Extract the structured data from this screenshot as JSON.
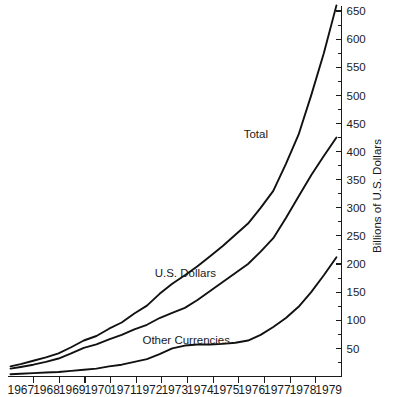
{
  "chart_data": {
    "type": "line",
    "title": "",
    "xlabel": "",
    "ylabel": "Billions of U.S. Dollars",
    "xlim": [
      1966.5,
      1979.7
    ],
    "ylim": [
      0,
      675
    ],
    "grid": false,
    "legend_position": "inline-labels",
    "x_tick_labels": [
      "1967",
      "1968",
      "1969",
      "1970",
      "1971",
      "1972",
      "1973",
      "1974",
      "1975",
      "1976",
      "1977",
      "1978",
      "1979"
    ],
    "y_tick_labels": [
      "50",
      "100",
      "150",
      "200",
      "250",
      "300",
      "350",
      "400",
      "450",
      "500",
      "550",
      "600",
      "650"
    ],
    "y_ticks": [
      50,
      100,
      150,
      200,
      250,
      300,
      350,
      400,
      450,
      500,
      550,
      600,
      650
    ],
    "y_minor_ticks": [
      25,
      75,
      125,
      175,
      225,
      275,
      325,
      375,
      425,
      475,
      525,
      575,
      625
    ],
    "x": [
      1966.6,
      1967,
      1967.5,
      1968,
      1968.5,
      1969,
      1969.5,
      1970,
      1970.5,
      1971,
      1971.5,
      1972,
      1972.5,
      1973,
      1973.5,
      1974,
      1974.5,
      1975,
      1975.5,
      1976,
      1976.5,
      1977,
      1977.5,
      1978,
      1978.5,
      1979,
      1979.5
    ],
    "series": [
      {
        "name": "Total",
        "label": "Total",
        "values": [
          18,
          22,
          28,
          34,
          41,
          52,
          64,
          72,
          85,
          96,
          112,
          126,
          147,
          165,
          180,
          196,
          214,
          232,
          252,
          272,
          300,
          330,
          378,
          430,
          500,
          575,
          660
        ]
      },
      {
        "name": "U.S. Dollars",
        "label": "U.S. Dollars",
        "values": [
          14,
          17,
          21,
          26,
          32,
          41,
          51,
          57,
          66,
          74,
          84,
          92,
          104,
          113,
          122,
          136,
          152,
          168,
          184,
          200,
          222,
          246,
          282,
          320,
          358,
          392,
          425
        ]
      },
      {
        "name": "Other Currencies",
        "label": "Other Currencies",
        "values": [
          4,
          5,
          6,
          7,
          8,
          10,
          12,
          14,
          18,
          21,
          26,
          31,
          40,
          50,
          55,
          57,
          57,
          58,
          60,
          64,
          74,
          88,
          104,
          124,
          150,
          180,
          212
        ]
      }
    ],
    "annotations": [
      {
        "text": "Total",
        "x_px": 268,
        "y_px": 138
      },
      {
        "text": "U.S. Dollars",
        "x_px": 216,
        "y_px": 277
      },
      {
        "text": "Other Currencies",
        "x_px": 230,
        "y_px": 344
      }
    ]
  },
  "axis": {
    "y_title": "Billions of U.S. Dollars"
  },
  "caption": {
    "ghost_text": ""
  }
}
